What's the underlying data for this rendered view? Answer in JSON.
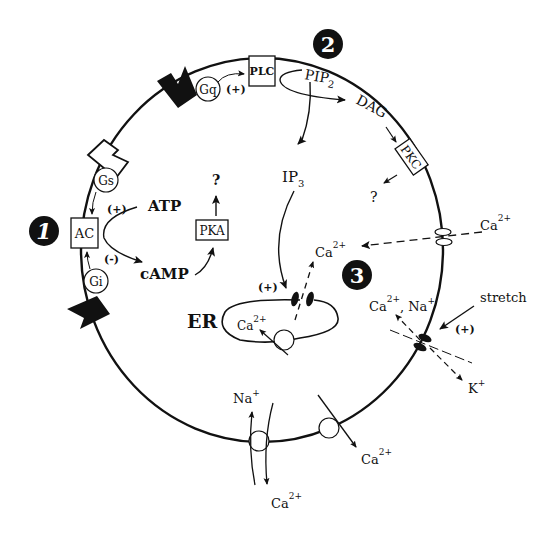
{
  "sections": {
    "one": "1",
    "two": "2",
    "three": "3"
  },
  "pathway1": {
    "ac": "AC",
    "gs": "Gs",
    "gi": "Gi",
    "plus": "(+)",
    "minus": "(-)",
    "atp": "ATP",
    "camp": "cAMP",
    "pka": "PKA",
    "question": "?"
  },
  "pathway2": {
    "plc": "PLC",
    "gq": "Gq",
    "plus": "(+)",
    "pip2": "PIP",
    "pip2_sub": "2",
    "dag": "DAG",
    "pkc": "PKC",
    "question": "?",
    "ip3": "IP",
    "ip3_sub": "3",
    "er_plus": "(+)",
    "er": "ER"
  },
  "pathway3": {
    "ca_out": "Ca",
    "ca_in": "Ca",
    "ca_na": "Ca",
    "na_after": ", Na",
    "stretch": "stretch",
    "plus": "(+)",
    "k": "K",
    "sup_2plus": "2+",
    "sup_plus": "+"
  },
  "er_ca": "Ca",
  "exchanger": {
    "na": "Na",
    "ca": "Ca"
  },
  "pump": {
    "ca": "Ca"
  }
}
